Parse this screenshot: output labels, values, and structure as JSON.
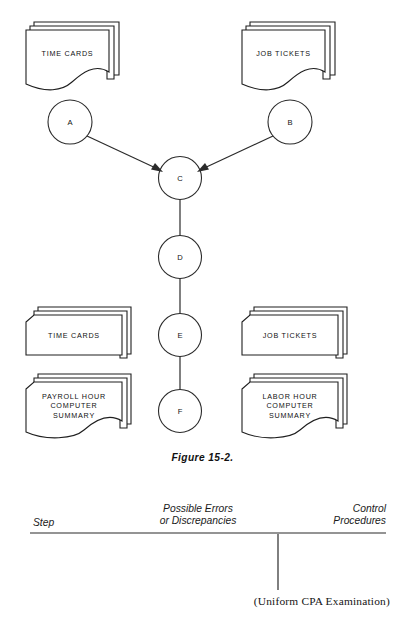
{
  "figure": {
    "caption": "Figure 15-2.",
    "source_note": "(Uniform CPA Examination)"
  },
  "documents": [
    {
      "id": "time-cards-top",
      "label": "TIME CARDS",
      "shape": "document"
    },
    {
      "id": "job-tickets-top",
      "label": "JOB TICKETS",
      "shape": "document"
    },
    {
      "id": "time-cards-bottom",
      "label": "TIME CARDS",
      "shape": "card"
    },
    {
      "id": "job-tickets-bottom",
      "label": "JOB TICKETS",
      "shape": "card"
    },
    {
      "id": "payroll-summary",
      "label": "PAYROLL HOUR\nCOMPUTER\nSUMMARY",
      "shape": "document"
    },
    {
      "id": "labor-summary",
      "label": "LABOR HOUR\nCOMPUTER\nSUMMARY",
      "shape": "document"
    }
  ],
  "nodes": [
    {
      "id": "a",
      "label": "A",
      "cx": 70,
      "cy": 122
    },
    {
      "id": "b",
      "label": "B",
      "cx": 290,
      "cy": 122
    },
    {
      "id": "c",
      "label": "C",
      "cx": 180,
      "cy": 178
    },
    {
      "id": "d",
      "label": "D",
      "cx": 180,
      "cy": 257
    },
    {
      "id": "e",
      "label": "E",
      "cx": 180,
      "cy": 335
    },
    {
      "id": "f",
      "label": "F",
      "cx": 180,
      "cy": 411
    }
  ],
  "connections": [
    {
      "from": "a",
      "to": "c",
      "arrow": true
    },
    {
      "from": "b",
      "to": "c",
      "arrow": true
    },
    {
      "from": "c",
      "to": "d",
      "arrow": false
    },
    {
      "from": "d",
      "to": "e",
      "arrow": false
    },
    {
      "from": "e",
      "to": "f",
      "arrow": false
    }
  ],
  "table": {
    "headers": [
      {
        "id": "step",
        "label": "Step"
      },
      {
        "id": "errors",
        "label": "Possible Errors\nor Discrepancies"
      },
      {
        "id": "control",
        "label": "Control\nProcedures"
      }
    ]
  },
  "colors": {
    "ink": "#1f1f1f",
    "page": "#ffffff"
  }
}
